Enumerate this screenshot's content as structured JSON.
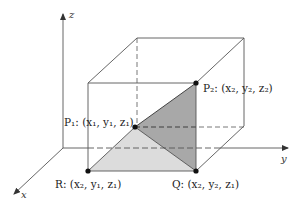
{
  "diagram": {
    "type": "3d-coordinate-box",
    "axes": {
      "x": {
        "label": "x"
      },
      "y": {
        "label": "y"
      },
      "z": {
        "label": "z"
      }
    },
    "points": {
      "P1": {
        "label": "P₁: (x₁, y₁, z₁)",
        "name": "P1",
        "coords": "(x1, y1, z1)"
      },
      "P2": {
        "label": "P₂: (x₂, y₂, z₂)",
        "name": "P2",
        "coords": "(x2, y2, z2)"
      },
      "R": {
        "label": "R: (x₂, y₁, z₁)",
        "name": "R",
        "coords": "(x2, y1, z1)"
      },
      "Q": {
        "label": "Q: (x₂, y₂, z₁)",
        "name": "Q",
        "coords": "(x2, y2, z1)"
      }
    },
    "shaded_triangles": [
      {
        "vertices": [
          "P1",
          "R",
          "Q"
        ],
        "color": "#d9d9d9"
      },
      {
        "vertices": [
          "P1",
          "Q",
          "P2"
        ],
        "color": "#a6a6a6"
      }
    ],
    "colors": {
      "line": "#555555",
      "light_fill": "#dcdcdc",
      "dark_fill": "#a8a8a8",
      "point": "#111111"
    }
  }
}
